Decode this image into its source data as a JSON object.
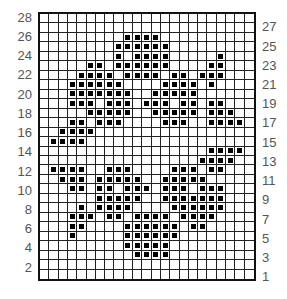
{
  "chart": {
    "title": "",
    "columns": 23,
    "rows": 28,
    "left_labels": [
      "28",
      "26",
      "24",
      "22",
      "20",
      "18",
      "16",
      "14",
      "12",
      "10",
      "8",
      "6",
      "4",
      "2"
    ],
    "right_labels": [
      "27",
      "25",
      "23",
      "21",
      "19",
      "17",
      "15",
      "13",
      "11",
      "9",
      "7",
      "5",
      "3",
      "1"
    ],
    "colors": {
      "grid_line": "#222222",
      "fill": "#000000",
      "label": "#555555"
    }
  },
  "chart_data": {
    "type": "heatmap",
    "columns": 23,
    "row_numbers_top_to_bottom": [
      28,
      27,
      26,
      25,
      24,
      23,
      22,
      21,
      20,
      19,
      18,
      17,
      16,
      15,
      14,
      13,
      12,
      11,
      10,
      9,
      8,
      7,
      6,
      5,
      4,
      3,
      2,
      1
    ],
    "filled_cells_by_row": {
      "28": [],
      "27": [],
      "26": [
        9,
        10,
        11,
        12
      ],
      "25": [
        8,
        9,
        10,
        11,
        12,
        13
      ],
      "24": [
        8,
        10,
        11,
        12,
        13,
        19
      ],
      "23": [
        5,
        6,
        8,
        9,
        10,
        11,
        12,
        13,
        18,
        19
      ],
      "22": [
        4,
        5,
        6,
        7,
        9,
        10,
        11,
        12,
        14,
        15,
        17,
        18,
        19
      ],
      "21": [
        3,
        4,
        5,
        6,
        7,
        8,
        13,
        14,
        15,
        16,
        18
      ],
      "20": [
        3,
        4,
        5,
        6,
        7,
        8,
        9,
        12,
        13,
        14,
        15,
        16
      ],
      "19": [
        3,
        4,
        5,
        7,
        8,
        9,
        11,
        12,
        13,
        15,
        16,
        18,
        19
      ],
      "18": [
        5,
        6,
        7,
        8,
        9,
        12,
        13,
        14,
        15,
        16,
        18,
        19,
        20
      ],
      "17": [
        3,
        4,
        6,
        7,
        8,
        13,
        14,
        15,
        18,
        19,
        20,
        21
      ],
      "16": [
        2,
        3,
        4,
        5
      ],
      "15": [
        1,
        2,
        3,
        4
      ],
      "14": [
        18,
        19,
        20,
        21
      ],
      "13": [
        17,
        18,
        19,
        20
      ],
      "12": [
        1,
        2,
        3,
        4,
        7,
        8,
        9,
        14,
        15,
        16,
        18,
        19
      ],
      "11": [
        2,
        3,
        4,
        6,
        7,
        8,
        9,
        10,
        13,
        14,
        15,
        16,
        17
      ],
      "10": [
        3,
        4,
        6,
        7,
        9,
        10,
        11,
        13,
        14,
        15,
        17,
        18,
        19
      ],
      "9": [
        6,
        7,
        8,
        9,
        10,
        13,
        14,
        15,
        16,
        17,
        18,
        19
      ],
      "8": [
        4,
        6,
        7,
        8,
        9,
        14,
        15,
        16,
        17,
        18,
        19
      ],
      "7": [
        3,
        4,
        5,
        7,
        8,
        10,
        11,
        12,
        13,
        15,
        16,
        17,
        18
      ],
      "6": [
        3,
        4,
        9,
        10,
        11,
        12,
        13,
        14,
        16,
        17
      ],
      "5": [
        3,
        9,
        10,
        11,
        12,
        13,
        14
      ],
      "4": [
        9,
        10,
        11,
        12,
        13
      ],
      "3": [
        10,
        11,
        12,
        13
      ],
      "2": [],
      "1": []
    },
    "column_index_base": 0,
    "left_axis_ticks": [
      28,
      26,
      24,
      22,
      20,
      18,
      16,
      14,
      12,
      10,
      8,
      6,
      4,
      2
    ],
    "right_axis_ticks": [
      27,
      25,
      23,
      21,
      19,
      17,
      15,
      13,
      11,
      9,
      7,
      5,
      3,
      1
    ],
    "grid": true,
    "legend": null
  }
}
